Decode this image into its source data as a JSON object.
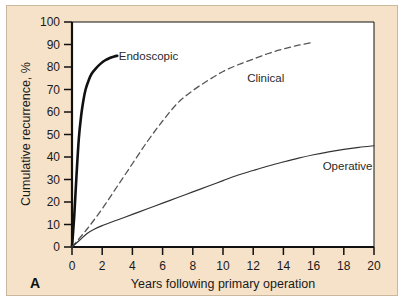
{
  "figure": {
    "panel_letter": "A",
    "background_color": "#f6e2c8",
    "plot_background_color": "#ffffff",
    "border_color": "#cbb79b"
  },
  "chart_data": {
    "type": "line",
    "title": "",
    "subtitle": "",
    "xlabel": "Years following primary operation",
    "ylabel": "Cumulative recurrence, %",
    "xlim": [
      0,
      20
    ],
    "ylim": [
      0,
      100
    ],
    "xticks": [
      0,
      2,
      4,
      6,
      8,
      10,
      12,
      14,
      16,
      18,
      20
    ],
    "yticks": [
      0,
      10,
      20,
      30,
      40,
      50,
      60,
      70,
      80,
      90,
      100
    ],
    "xtick_labels": [
      "0",
      "2",
      "4",
      "6",
      "8",
      "10",
      "12",
      "14",
      "16",
      "18",
      "20"
    ],
    "ytick_labels": [
      "0",
      "10",
      "20",
      "30",
      "40",
      "50",
      "60",
      "70",
      "80",
      "90",
      "100"
    ],
    "grid": false,
    "legend": "inline-annotations",
    "legend_position": "on-curve",
    "annotations": [
      {
        "text": "Endoscopic",
        "x": 3.1,
        "y": 85
      },
      {
        "text": "Clinical",
        "x": 11.6,
        "y": 75
      },
      {
        "text": "Operative",
        "x": 16.6,
        "y": 36
      }
    ],
    "series": [
      {
        "name": "Endoscopic",
        "style": "solid-thick",
        "color": "#111111",
        "linewidth": 2.6,
        "x": [
          0,
          0.15,
          0.3,
          0.45,
          0.6,
          0.75,
          0.9,
          1.1,
          1.3,
          1.6,
          1.9,
          2.2,
          2.5,
          2.8,
          3.0
        ],
        "y": [
          0,
          14,
          32,
          48,
          58,
          65,
          70,
          74,
          77,
          79.5,
          81.5,
          83,
          84,
          84.7,
          85
        ]
      },
      {
        "name": "Clinical",
        "style": "dashed",
        "color": "#555555",
        "linewidth": 1.3,
        "x": [
          0,
          1,
          2,
          3,
          4,
          5,
          6,
          7,
          8,
          9,
          10,
          11,
          12,
          13,
          14,
          15,
          16
        ],
        "y": [
          0,
          8,
          17,
          27,
          37,
          47,
          56,
          64,
          69.5,
          74,
          78,
          81,
          83.5,
          86,
          88,
          89.7,
          91
        ]
      },
      {
        "name": "Operative",
        "style": "solid-thin",
        "color": "#333333",
        "linewidth": 1.2,
        "x": [
          0,
          0.5,
          1,
          1.5,
          2,
          3,
          4,
          5,
          6,
          7,
          8,
          9,
          10,
          11,
          12,
          13,
          14,
          15,
          16,
          17,
          18,
          19,
          20
        ],
        "y": [
          0,
          3,
          6,
          8,
          9.5,
          12,
          14.5,
          17,
          19.5,
          22,
          24.5,
          27,
          29.5,
          32,
          34,
          36,
          37.8,
          39.5,
          41,
          42.3,
          43.4,
          44.3,
          45
        ]
      }
    ]
  }
}
